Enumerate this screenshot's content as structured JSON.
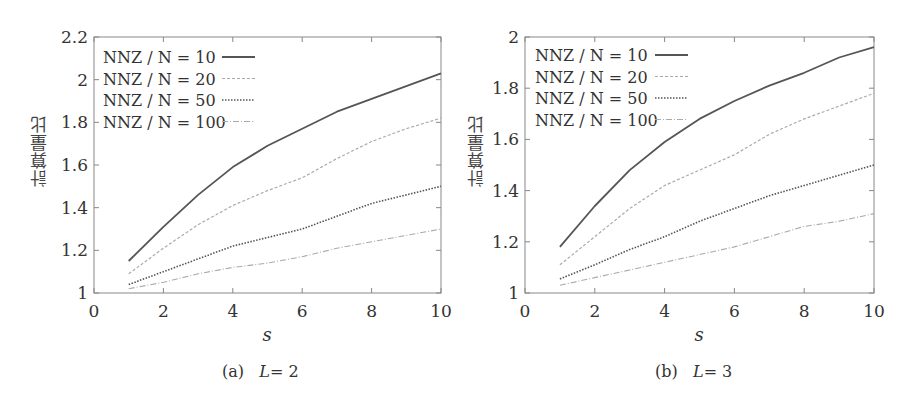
{
  "chart_data": [
    {
      "type": "line",
      "panel": "a",
      "caption_label": "(a)",
      "caption_var": "L",
      "caption_value": "= 2",
      "title": "(a) L = 2",
      "xlabel": "s",
      "ylabel": "計算量比",
      "xlim": [
        0,
        10
      ],
      "ylim": [
        1,
        2.2
      ],
      "xticks": [
        "0",
        "2",
        "4",
        "6",
        "8",
        "10"
      ],
      "yticks": [
        "1",
        "1.2",
        "1.4",
        "1.6",
        "1.8",
        "2",
        "2.2"
      ],
      "grid": false,
      "legend_position": "upper-left",
      "x": [
        1,
        2,
        3,
        4,
        5,
        6,
        7,
        8,
        9,
        10
      ],
      "series": [
        {
          "name": "NNZ / N = 10",
          "style": "solid",
          "color": "#555555",
          "values": [
            1.15,
            1.31,
            1.46,
            1.59,
            1.69,
            1.77,
            1.85,
            1.91,
            1.97,
            2.03
          ]
        },
        {
          "name": "NNZ / N = 20",
          "style": "dashed",
          "color": "#aaaaaa",
          "values": [
            1.09,
            1.21,
            1.32,
            1.41,
            1.48,
            1.54,
            1.63,
            1.71,
            1.77,
            1.82
          ]
        },
        {
          "name": "NNZ / N = 50",
          "style": "dotted",
          "color": "#555555",
          "values": [
            1.04,
            1.1,
            1.16,
            1.22,
            1.26,
            1.3,
            1.36,
            1.42,
            1.46,
            1.5
          ]
        },
        {
          "name": "NNZ / N = 100",
          "style": "dashdot",
          "color": "#aaaaaa",
          "values": [
            1.02,
            1.05,
            1.09,
            1.12,
            1.14,
            1.17,
            1.21,
            1.24,
            1.27,
            1.3
          ]
        }
      ]
    },
    {
      "type": "line",
      "panel": "b",
      "caption_label": "(b)",
      "caption_var": "L",
      "caption_value": "= 3",
      "title": "(b) L = 3",
      "xlabel": "s",
      "ylabel": "計算量比",
      "xlim": [
        0,
        10
      ],
      "ylim": [
        1,
        2
      ],
      "xticks": [
        "0",
        "2",
        "4",
        "6",
        "8",
        "10"
      ],
      "yticks": [
        "1",
        "1.2",
        "1.4",
        "1.6",
        "1.8",
        "2"
      ],
      "grid": false,
      "legend_position": "upper-left",
      "x": [
        1,
        2,
        3,
        4,
        5,
        6,
        7,
        8,
        9,
        10
      ],
      "series": [
        {
          "name": "NNZ / N = 10",
          "style": "solid",
          "color": "#555555",
          "values": [
            1.18,
            1.34,
            1.48,
            1.59,
            1.68,
            1.75,
            1.81,
            1.86,
            1.92,
            1.96
          ]
        },
        {
          "name": "NNZ / N = 20",
          "style": "dashed",
          "color": "#aaaaaa",
          "values": [
            1.11,
            1.22,
            1.33,
            1.42,
            1.48,
            1.54,
            1.62,
            1.68,
            1.73,
            1.78
          ]
        },
        {
          "name": "NNZ / N = 50",
          "style": "dotted",
          "color": "#555555",
          "values": [
            1.055,
            1.11,
            1.17,
            1.22,
            1.28,
            1.33,
            1.38,
            1.42,
            1.46,
            1.5
          ]
        },
        {
          "name": "NNZ / N = 100",
          "style": "dashdot",
          "color": "#aaaaaa",
          "values": [
            1.03,
            1.06,
            1.09,
            1.12,
            1.15,
            1.18,
            1.22,
            1.26,
            1.28,
            1.31
          ]
        }
      ]
    }
  ]
}
